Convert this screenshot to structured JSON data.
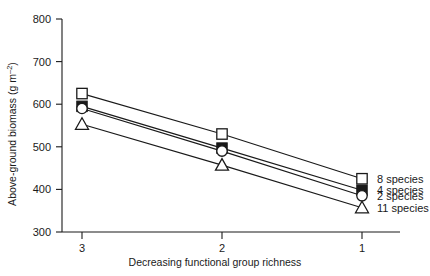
{
  "chart_data": {
    "type": "line",
    "title": "",
    "xlabel": "Decreasing functional group richness",
    "ylabel": "Above-ground biomass (g m²)",
    "ylabel_parts": {
      "main": "Above-ground biomass (g m",
      "sup": "–2",
      "tail": ")"
    },
    "x": [
      3,
      2,
      1
    ],
    "categories": [
      "3",
      "2",
      "1"
    ],
    "xticklabels": [
      "3",
      "2",
      "1"
    ],
    "yticklabels": [
      "300",
      "400",
      "500",
      "600",
      "700",
      "800"
    ],
    "yticks": [
      300,
      400,
      500,
      600,
      700,
      800
    ],
    "ylim": [
      300,
      800
    ],
    "xlim": [
      3.2,
      0.72
    ],
    "grid": false,
    "legend_position": "right-inside",
    "series": [
      {
        "name": "8 species",
        "label": "8 species",
        "marker": "open-square",
        "values": [
          625,
          530,
          425
        ]
      },
      {
        "name": "4 species",
        "label": "4 species",
        "marker": "filled-square",
        "values": [
          595,
          497,
          398
        ]
      },
      {
        "name": "2 species",
        "label": "2 species",
        "marker": "open-circle",
        "values": [
          590,
          490,
          385
        ]
      },
      {
        "name": "11 species",
        "label": "11 species",
        "marker": "open-triangle",
        "values": [
          553,
          457,
          357
        ]
      }
    ]
  },
  "colors": {
    "ink": "#1a1a1a",
    "background": "#ffffff",
    "marker_fill_open": "#ffffff"
  }
}
